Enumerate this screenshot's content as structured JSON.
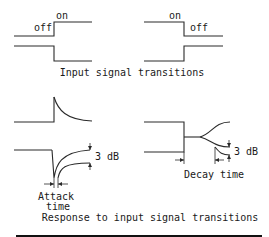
{
  "diagram": {
    "top_section": {
      "left_signal": {
        "label_off": "off",
        "label_on": "on"
      },
      "right_signal": {
        "label_on": "on",
        "label_off": "off"
      },
      "caption": "Input signal transitions"
    },
    "bottom_section": {
      "attack": {
        "level_label": "3 dB",
        "time_label_line1": "Attack",
        "time_label_line2": "time"
      },
      "decay": {
        "level_label": "3 dB",
        "time_label": "Decay time"
      },
      "caption": "Response to input signal transitions"
    }
  }
}
